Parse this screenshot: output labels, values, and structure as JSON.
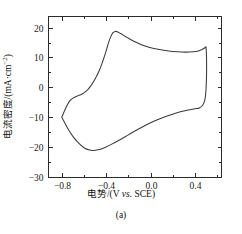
{
  "figure": {
    "caption": "(a)",
    "background": "#ffffff",
    "frame_color": "#2b2b2b",
    "curve_color": "#3a3a3a"
  },
  "chart_data": {
    "type": "line",
    "title": "",
    "subtitle": "",
    "xlabel_parts": {
      "pre": "电势/(V ",
      "italic": "vs.",
      "post": " SCE)"
    },
    "xlabel": "电势/(V vs. SCE)",
    "ylabel_parts": {
      "pre": "电流密度/(mA·cm",
      "sup": "−2",
      "post": ")"
    },
    "ylabel": "电流密度/(mA·cm−2)",
    "xlim": [
      -0.92,
      0.64
    ],
    "ylim": [
      -30,
      23.7
    ],
    "xticks": [
      -0.8,
      -0.4,
      0.0,
      0.4
    ],
    "xticklabels": [
      "−0.8",
      "−0.4",
      "0.0",
      "0.4"
    ],
    "yticks": [
      20,
      10,
      0,
      -10,
      -20,
      -30
    ],
    "yticklabels": [
      "20",
      "10",
      "0",
      "−10",
      "−20",
      "−30"
    ],
    "minor_xticks": [
      -0.6,
      -0.2,
      0.2,
      0.6
    ],
    "minor_yticks": [
      15,
      5,
      -5,
      -15,
      -25
    ],
    "grid": false,
    "legend": null,
    "annotations": [],
    "series": [
      {
        "name": "cyclic voltammogram",
        "closed": true,
        "forward_scan": [
          [
            -0.8,
            -10.0
          ],
          [
            -0.76,
            -6.6
          ],
          [
            -0.73,
            -4.6
          ],
          [
            -0.7,
            -3.6
          ],
          [
            -0.66,
            -2.9
          ],
          [
            -0.62,
            -2.3
          ],
          [
            -0.58,
            -1.3
          ],
          [
            -0.54,
            0.4
          ],
          [
            -0.5,
            2.8
          ],
          [
            -0.46,
            5.8
          ],
          [
            -0.43,
            8.8
          ],
          [
            -0.4,
            12.2
          ],
          [
            -0.38,
            14.8
          ],
          [
            -0.36,
            16.8
          ],
          [
            -0.34,
            18.2
          ],
          [
            -0.32,
            18.7
          ],
          [
            -0.3,
            18.6
          ],
          [
            -0.27,
            18.0
          ],
          [
            -0.23,
            17.1
          ],
          [
            -0.18,
            16.0
          ],
          [
            -0.12,
            14.9
          ],
          [
            -0.05,
            13.8
          ],
          [
            0.03,
            13.0
          ],
          [
            0.12,
            12.4
          ],
          [
            0.2,
            12.0
          ],
          [
            0.28,
            11.8
          ],
          [
            0.35,
            11.8
          ],
          [
            0.41,
            12.0
          ],
          [
            0.45,
            12.4
          ],
          [
            0.48,
            13.0
          ],
          [
            0.5,
            13.6
          ]
        ],
        "reverse_scan": [
          [
            0.5,
            13.6
          ],
          [
            0.505,
            10.0
          ],
          [
            0.505,
            4.0
          ],
          [
            0.5,
            -1.0
          ],
          [
            0.49,
            -4.2
          ],
          [
            0.47,
            -6.0
          ],
          [
            0.44,
            -6.9
          ],
          [
            0.4,
            -7.2
          ],
          [
            0.34,
            -7.6
          ],
          [
            0.27,
            -8.2
          ],
          [
            0.2,
            -9.0
          ],
          [
            0.12,
            -10.0
          ],
          [
            0.04,
            -11.2
          ],
          [
            -0.04,
            -12.6
          ],
          [
            -0.12,
            -14.2
          ],
          [
            -0.2,
            -15.9
          ],
          [
            -0.28,
            -17.6
          ],
          [
            -0.35,
            -19.0
          ],
          [
            -0.41,
            -20.1
          ],
          [
            -0.46,
            -20.8
          ],
          [
            -0.51,
            -21.1
          ],
          [
            -0.55,
            -21.0
          ],
          [
            -0.6,
            -20.2
          ],
          [
            -0.65,
            -18.6
          ],
          [
            -0.7,
            -16.4
          ],
          [
            -0.75,
            -13.5
          ],
          [
            -0.8,
            -10.0
          ]
        ],
        "peak_anodic": {
          "potential": -0.32,
          "current": 18.7
        },
        "peak_cathodic": {
          "potential": -0.51,
          "current": -21.1
        },
        "switching_potential_positive": 0.5,
        "switching_potential_negative": -0.8
      }
    ]
  }
}
